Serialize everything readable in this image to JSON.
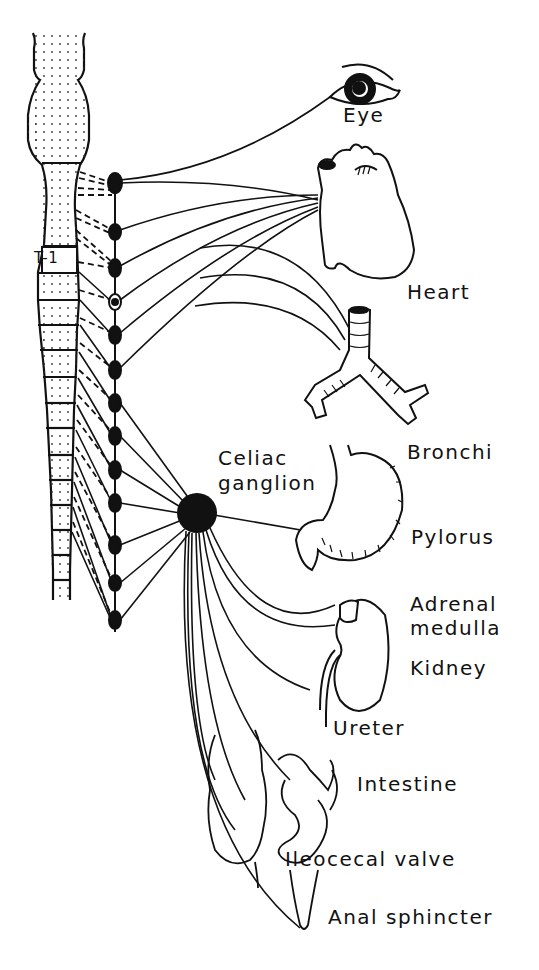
{
  "diagram": {
    "spine_segment_label": "T-1",
    "labels": {
      "eye": "Eye",
      "heart": "Heart",
      "bronchi": "Bronchi",
      "celiac_line1": "Celiac",
      "celiac_line2": "ganglion",
      "pylorus": "Pylorus",
      "adrenal_line1": "Adrenal",
      "adrenal_line2": "medulla",
      "kidney": "Kidney",
      "ureter": "Ureter",
      "intestine": "Intestine",
      "ileocecal": "Ileocecal valve",
      "anal": "Anal sphincter"
    },
    "colors": {
      "ink": "#111111",
      "background": "#ffffff"
    },
    "chain_ganglia_y": [
      183,
      232,
      268,
      302,
      335,
      370,
      403,
      436,
      470,
      503,
      545,
      583,
      620
    ]
  }
}
